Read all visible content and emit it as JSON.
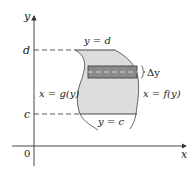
{
  "figure": {
    "type": "region-between-curves-dy",
    "colors": {
      "region_fill": "#dcdcdc",
      "strip_fill": "#8a8a8a",
      "strip_inner": "#a6a6a6",
      "line": "#333333",
      "background": "#ffffff"
    },
    "axes": {
      "x_label": "x",
      "y_label": "y",
      "origin_label": "0"
    },
    "ticks": {
      "d_label": "d",
      "c_label": "c"
    },
    "boundary_labels": {
      "top": "y = d",
      "bottom": "y = c",
      "left": "x = g(y)",
      "right": "x = f(y)"
    },
    "strip_label": "Δy"
  }
}
